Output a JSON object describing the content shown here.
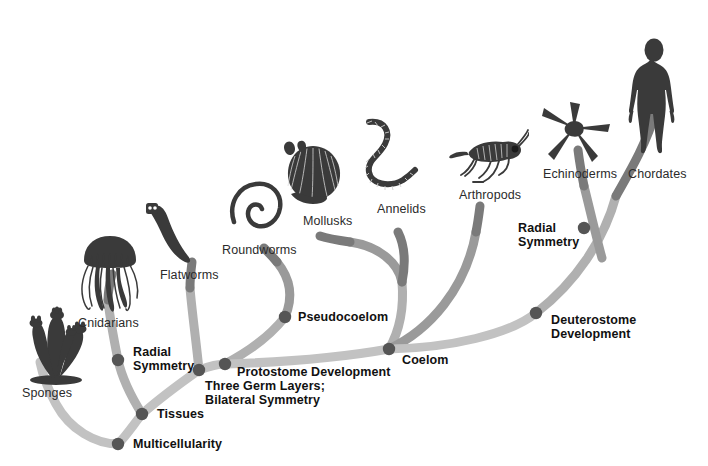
{
  "figure": {
    "kind": "phylogenetic-tree",
    "background_color": "#ffffff",
    "node_color": "#555555",
    "branch_color_dark": "#6e6e6e",
    "branch_color_light": "#b8b8b8",
    "organism_color": "#3a3a3a",
    "taxon_text_color": "#2b2b2b",
    "trait_text_color": "#111111"
  },
  "taxa": [
    {
      "id": "sponges",
      "label": "Sponges",
      "x": 22,
      "y": 386
    },
    {
      "id": "cnidarians",
      "label": "Cnidarians",
      "x": 78,
      "y": 316
    },
    {
      "id": "flatworms",
      "label": "Flatworms",
      "x": 160,
      "y": 268
    },
    {
      "id": "roundworms",
      "label": "Roundworms",
      "x": 222,
      "y": 243
    },
    {
      "id": "mollusks",
      "label": "Mollusks",
      "x": 303,
      "y": 214
    },
    {
      "id": "annelids",
      "label": "Annelids",
      "x": 377,
      "y": 202
    },
    {
      "id": "arthropods",
      "label": "Arthropods",
      "x": 459,
      "y": 188
    },
    {
      "id": "echinoderms",
      "label": "Echinoderms",
      "x": 543,
      "y": 167
    },
    {
      "id": "chordates",
      "label": "Chordates",
      "x": 628,
      "y": 167
    }
  ],
  "traits": [
    {
      "id": "multicellularity",
      "label": "Multicellularity",
      "node_x": 118,
      "node_y": 444,
      "text_x": 133,
      "text_y": 437
    },
    {
      "id": "tissues",
      "label": "Tissues",
      "node_x": 142,
      "node_y": 414,
      "text_x": 157,
      "text_y": 407
    },
    {
      "id": "radial-symmetry-left",
      "label": "Radial\nSymmetry",
      "node_x": 118,
      "node_y": 360,
      "text_x": 133,
      "text_y": 345
    },
    {
      "id": "three-germ-layers",
      "label": "Three Germ Layers;\nBilateral Symmetry",
      "node_x": 199,
      "node_y": 370,
      "text_x": 205,
      "text_y": 379
    },
    {
      "id": "protostome-development",
      "label": "Protostome Development",
      "node_x": 225,
      "node_y": 364,
      "text_x": 237,
      "text_y": 365
    },
    {
      "id": "pseudocoelom",
      "label": "Pseudocoelom",
      "node_x": 285,
      "node_y": 317,
      "text_x": 298,
      "text_y": 310
    },
    {
      "id": "coelom",
      "label": "Coelom",
      "node_x": 389,
      "node_y": 349,
      "text_x": 402,
      "text_y": 353
    },
    {
      "id": "deuterostome-development",
      "label": "Deuterostome\nDevelopment",
      "node_x": 536,
      "node_y": 313,
      "text_x": 551,
      "text_y": 313
    },
    {
      "id": "radial-symmetry-right",
      "label": "Radial\nSymmetry",
      "node_x": 584,
      "node_y": 228,
      "text_x": 518,
      "text_y": 221
    }
  ],
  "branches": [
    {
      "id": "branch-sponges",
      "d": "M 118 444 C 96 444 70 430 56 404 C 46 386 42 372 40 362",
      "color": "#c2c2c2",
      "width": 9
    },
    {
      "id": "branch-trunk-1",
      "d": "M 118 444 C 126 436 134 424 142 414",
      "color": "#c2c2c2",
      "width": 9
    },
    {
      "id": "branch-cnidarians",
      "d": "M 142 414 C 132 398 122 378 118 360 C 114 340 110 320 108 300",
      "color": "#b0b0b0",
      "width": 9
    },
    {
      "id": "branch-cnid-stem",
      "d": "M 108 300 C 108 290 110 282 112 274",
      "color": "#7a7a7a",
      "width": 9
    },
    {
      "id": "branch-trunk-2",
      "d": "M 142 414 C 160 398 182 382 199 370",
      "color": "#c2c2c2",
      "width": 9
    },
    {
      "id": "branch-flatworms",
      "d": "M 199 370 C 196 340 192 312 190 288",
      "color": "#b0b0b0",
      "width": 9
    },
    {
      "id": "branch-flatworm-stem",
      "d": "M 190 288 C 190 278 191 270 192 262",
      "color": "#7a7a7a",
      "width": 9
    },
    {
      "id": "branch-trunk-3",
      "d": "M 199 370 C 210 366 218 364 225 364",
      "color": "#c2c2c2",
      "width": 9
    },
    {
      "id": "branch-pseudo",
      "d": "M 225 364 C 248 352 270 336 285 317",
      "color": "#b0b0b0",
      "width": 9
    },
    {
      "id": "branch-roundworms",
      "d": "M 285 317 C 294 296 290 278 277 262",
      "color": "#9a9a9a",
      "width": 9
    },
    {
      "id": "branch-roundworm-stem",
      "d": "M 277 262 C 272 256 268 252 264 248",
      "color": "#7a7a7a",
      "width": 9
    },
    {
      "id": "branch-proto-main",
      "d": "M 225 364 C 290 362 350 356 389 349",
      "color": "#c2c2c2",
      "width": 9
    },
    {
      "id": "branch-coelom-up",
      "d": "M 389 349 C 400 330 404 306 402 282",
      "color": "#b0b0b0",
      "width": 9
    },
    {
      "id": "branch-mollusk-annelid",
      "d": "M 402 282 C 398 262 378 246 350 242",
      "color": "#9a9a9a",
      "width": 9
    },
    {
      "id": "branch-mollusks",
      "d": "M 350 242 C 336 240 326 238 320 236",
      "color": "#7a7a7a",
      "width": 9
    },
    {
      "id": "branch-annelids",
      "d": "M 402 282 C 406 262 404 244 398 232",
      "color": "#7a7a7a",
      "width": 9
    },
    {
      "id": "branch-arthropods",
      "d": "M 389 349 C 430 330 466 288 476 232",
      "color": "#9a9a9a",
      "width": 9
    },
    {
      "id": "branch-arthropod-stem",
      "d": "M 476 232 C 478 222 479 214 480 206",
      "color": "#7a7a7a",
      "width": 9
    },
    {
      "id": "branch-deutero",
      "d": "M 389 349 C 450 348 510 334 536 313",
      "color": "#c2c2c2",
      "width": 9
    },
    {
      "id": "branch-deutero-up",
      "d": "M 536 313 C 576 282 604 240 616 196",
      "color": "#b0b0b0",
      "width": 9
    },
    {
      "id": "branch-echinoderms",
      "d": "M 602 258 C 596 236 590 210 584 186",
      "color": "#9a9a9a",
      "width": 9
    },
    {
      "id": "branch-echino-stem",
      "d": "M 584 186 C 582 176 580 166 578 150",
      "color": "#7a7a7a",
      "width": 9
    },
    {
      "id": "branch-chordates",
      "d": "M 616 196 C 632 168 648 140 656 110",
      "color": "#7a7a7a",
      "width": 9
    }
  ]
}
